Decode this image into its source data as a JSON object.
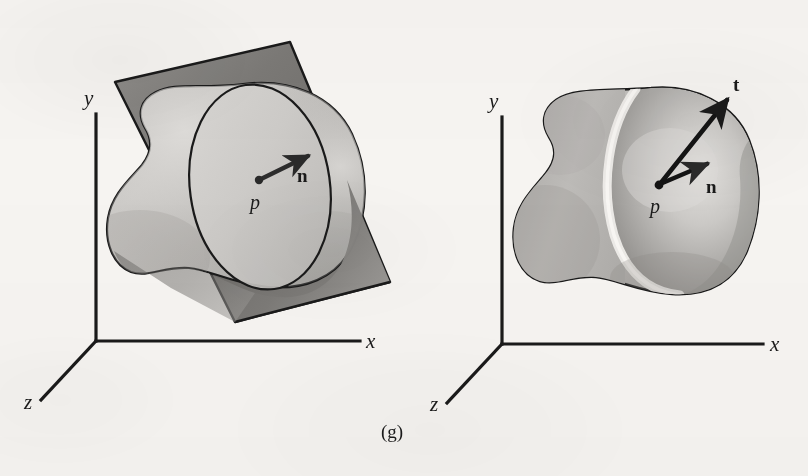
{
  "figure": {
    "caption": "(g)",
    "background_color": "#f6f4f1",
    "ink_color": "#1a1a1a",
    "panels": [
      {
        "id": "left",
        "name": "surface-with-tangent-plane",
        "axes": {
          "x_label": "x",
          "y_label": "y",
          "z_label": "z",
          "origin": [
            96,
            341
          ]
        },
        "point_label": "p",
        "vectors": [
          {
            "name": "normal",
            "label": "n"
          }
        ],
        "elements": [
          "blob-surface",
          "tangent-plane",
          "tangent-disc-ellipse",
          "normal-vector",
          "point-p"
        ]
      },
      {
        "id": "right",
        "name": "surface-with-normal-and-tangent",
        "axes": {
          "x_label": "x",
          "y_label": "y",
          "z_label": "z",
          "origin": [
            502,
            344
          ]
        },
        "point_label": "p",
        "vectors": [
          {
            "name": "normal",
            "label": "n"
          },
          {
            "name": "tangent",
            "label": "t"
          }
        ],
        "elements": [
          "blob-surface",
          "highlight-band",
          "normal-vector",
          "tangent-vector",
          "point-p"
        ]
      }
    ],
    "colors": {
      "surface_light": "#cfcdca",
      "surface_mid": "#b3b1ae",
      "surface_dark": "#8e8c89",
      "plane_dark": "#6e6c69",
      "plane_light": "#a9a7a4",
      "outline": "#1a1a1a",
      "highlight": "#eceae7"
    }
  }
}
